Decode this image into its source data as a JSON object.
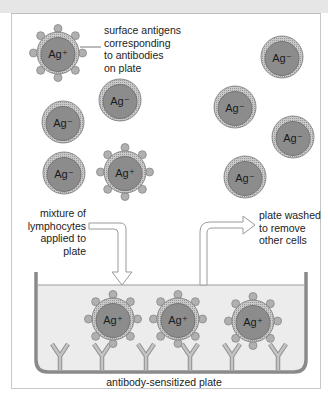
{
  "figure": {
    "labels": {
      "surface_antigens": "surface antigens\ncorresponding\nto antibodies\non plate",
      "mixture": "mixture of\nlymphocytes\napplied to plate",
      "washed": "plate washed\nto remove\nother cells",
      "plate": "antibody-sensitized plate"
    },
    "cell_labels": {
      "positive": "Ag⁺",
      "negative": "Ag⁻"
    },
    "cells": [
      {
        "id": "free-ag-pos-1",
        "type": "positive",
        "x": 58,
        "y": 53
      },
      {
        "id": "free-ag-neg-1",
        "type": "negative",
        "x": 120,
        "y": 100
      },
      {
        "id": "free-ag-neg-2",
        "type": "negative",
        "x": 63,
        "y": 122
      },
      {
        "id": "free-ag-neg-3",
        "type": "negative",
        "x": 64,
        "y": 173
      },
      {
        "id": "free-ag-pos-2",
        "type": "positive",
        "x": 125,
        "y": 172
      },
      {
        "id": "washed-ag-neg-1",
        "type": "negative",
        "x": 282,
        "y": 57
      },
      {
        "id": "washed-ag-neg-2",
        "type": "negative",
        "x": 235,
        "y": 107
      },
      {
        "id": "washed-ag-neg-3",
        "type": "negative",
        "x": 293,
        "y": 137
      },
      {
        "id": "washed-ag-neg-4",
        "type": "negative",
        "x": 245,
        "y": 177
      },
      {
        "id": "bound-ag-pos-1",
        "type": "positive",
        "x": 113,
        "y": 319
      },
      {
        "id": "bound-ag-pos-2",
        "type": "positive",
        "x": 178,
        "y": 319
      },
      {
        "id": "bound-ag-pos-3",
        "type": "positive",
        "x": 253,
        "y": 321
      }
    ],
    "antibodies_x": [
      60,
      102,
      146,
      190,
      232,
      278
    ],
    "colors": {
      "cell_outer": "#b4b4b4",
      "cell_inner": "#8c8c8c",
      "antigen": "#b0b0b0",
      "plate_wall": "#8a8a8a",
      "liquid": "#ebebeb",
      "antibody": "#c4c4c4"
    }
  }
}
